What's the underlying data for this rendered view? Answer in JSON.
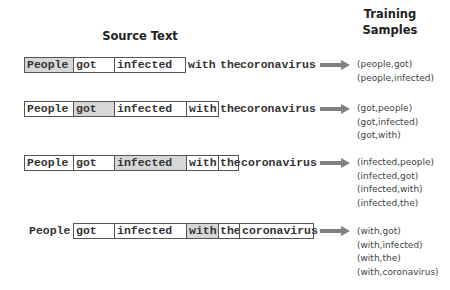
{
  "header": {
    "source_title": "Source Text",
    "samples_title_line1": "Training",
    "samples_title_line2": "Samples"
  },
  "colors": {
    "highlight": "#d7d7d7",
    "arrow": "#808080",
    "border": "#555555"
  },
  "rows": [
    {
      "target": "People",
      "words": [
        "People",
        "got",
        "infected",
        "with",
        "the",
        "coronavirus"
      ],
      "samples": [
        "(people,got)",
        "(people,infected)"
      ]
    },
    {
      "target": "got",
      "words": [
        "People",
        "got",
        "infected",
        "with",
        "the",
        "coronavirus"
      ],
      "samples": [
        "(got,people)",
        "(got,infected)",
        "(got,with)"
      ]
    },
    {
      "target": "infected",
      "words": [
        "People",
        "got",
        "infected",
        "with",
        "the",
        "coronavirus"
      ],
      "samples": [
        "(infected,people)",
        "(infected,got)",
        "(infected,with)",
        "(infected,the)"
      ]
    },
    {
      "target": "with",
      "words": [
        "People",
        "got",
        "infected",
        "with",
        "the",
        "coronavirus"
      ],
      "samples": [
        "(with,got)",
        "(with,infected)",
        "(with,the)",
        "(with,coronavirus)"
      ]
    }
  ]
}
